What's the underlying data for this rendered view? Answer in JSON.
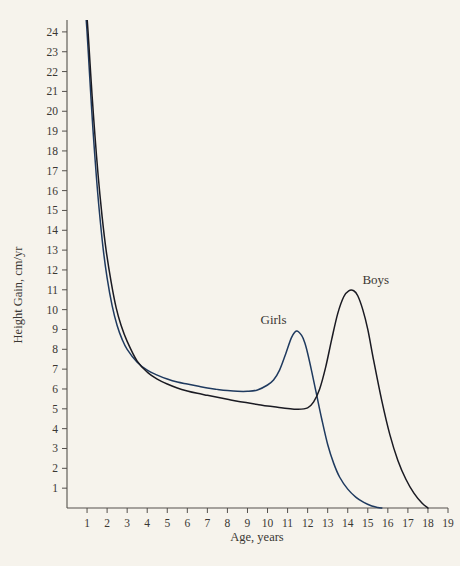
{
  "figure": {
    "background_color": "#f6f3ec",
    "axis_color": "#54504c",
    "text_color": "#3a3733"
  },
  "chart_data": {
    "type": "line",
    "title": "",
    "subtitle": "",
    "xlabel": "Age, years",
    "ylabel": "Height Gain, cm/yr",
    "xlim": [
      0,
      19
    ],
    "ylim": [
      0,
      24.6
    ],
    "grid": false,
    "legend_position": "inline-annotations",
    "xticks": [
      1,
      2,
      3,
      4,
      5,
      6,
      7,
      8,
      9,
      10,
      11,
      12,
      13,
      14,
      15,
      16,
      17,
      18,
      19
    ],
    "xtick_labels": [
      "1",
      "2",
      "3",
      "4",
      "5",
      "6",
      "7",
      "8",
      "9",
      "10",
      "11",
      "12",
      "13",
      "14",
      "15",
      "16",
      "17",
      "18",
      "19"
    ],
    "yticks": [
      1,
      2,
      3,
      4,
      5,
      6,
      7,
      8,
      9,
      10,
      11,
      12,
      13,
      14,
      15,
      16,
      17,
      18,
      19,
      20,
      21,
      22,
      23,
      24
    ],
    "ytick_labels": [
      "1",
      "2",
      "3",
      "4",
      "5",
      "6",
      "7",
      "8",
      "9",
      "10",
      "11",
      "12",
      "13",
      "14",
      "15",
      "16",
      "17",
      "18",
      "19",
      "20",
      "21",
      "22",
      "23",
      "24"
    ],
    "annotations": [
      {
        "text": "Girls",
        "x": 10.3,
        "y": 9.3
      },
      {
        "text": "Boys",
        "x": 15.4,
        "y": 11.3
      }
    ],
    "series": [
      {
        "name": "Girls",
        "color": "#1f3a5f",
        "x": [
          0.9,
          1.0,
          1.1,
          1.2,
          1.3,
          1.45,
          1.6,
          1.8,
          2.0,
          2.25,
          2.5,
          2.75,
          3.0,
          3.5,
          4.0,
          4.5,
          5.0,
          5.5,
          6.0,
          6.5,
          7.0,
          7.5,
          8.0,
          8.5,
          9.0,
          9.5,
          10.0,
          10.3,
          10.6,
          10.9,
          11.2,
          11.45,
          11.7,
          11.85,
          12.0,
          12.2,
          12.45,
          12.7,
          13.0,
          13.3,
          13.6,
          14.0,
          14.4,
          14.8,
          15.2,
          15.5,
          15.7
        ],
        "y": [
          25.4,
          24.0,
          22.3,
          20.6,
          19.0,
          16.9,
          15.1,
          13.1,
          11.6,
          10.2,
          9.2,
          8.5,
          8.0,
          7.35,
          6.95,
          6.7,
          6.5,
          6.35,
          6.25,
          6.15,
          6.05,
          5.98,
          5.92,
          5.88,
          5.88,
          5.95,
          6.2,
          6.45,
          6.95,
          7.75,
          8.6,
          8.92,
          8.7,
          8.35,
          7.8,
          6.9,
          5.7,
          4.5,
          3.2,
          2.25,
          1.55,
          0.95,
          0.55,
          0.28,
          0.1,
          0.03,
          0.0
        ]
      },
      {
        "name": "Boys",
        "color": "#1a1a22",
        "x": [
          0.95,
          1.05,
          1.15,
          1.25,
          1.4,
          1.55,
          1.75,
          1.95,
          2.2,
          2.45,
          2.7,
          3.0,
          3.5,
          4.0,
          4.5,
          5.0,
          5.5,
          6.0,
          6.5,
          7.0,
          7.5,
          8.0,
          8.5,
          9.0,
          9.5,
          10.0,
          10.5,
          11.0,
          11.5,
          12.0,
          12.3,
          12.6,
          12.9,
          13.2,
          13.5,
          13.8,
          14.05,
          14.3,
          14.5,
          14.75,
          15.0,
          15.3,
          15.7,
          16.1,
          16.5,
          16.9,
          17.3,
          17.7,
          18.0
        ],
        "y": [
          25.4,
          24.0,
          22.4,
          20.8,
          18.7,
          16.8,
          14.7,
          13.0,
          11.4,
          10.1,
          9.2,
          8.4,
          7.4,
          6.85,
          6.5,
          6.25,
          6.05,
          5.9,
          5.78,
          5.68,
          5.58,
          5.48,
          5.38,
          5.3,
          5.22,
          5.14,
          5.08,
          5.02,
          4.98,
          5.05,
          5.35,
          6.0,
          7.1,
          8.5,
          9.8,
          10.65,
          10.95,
          10.95,
          10.7,
          10.0,
          9.0,
          7.4,
          5.4,
          3.7,
          2.4,
          1.45,
          0.75,
          0.25,
          0.0
        ]
      }
    ]
  }
}
